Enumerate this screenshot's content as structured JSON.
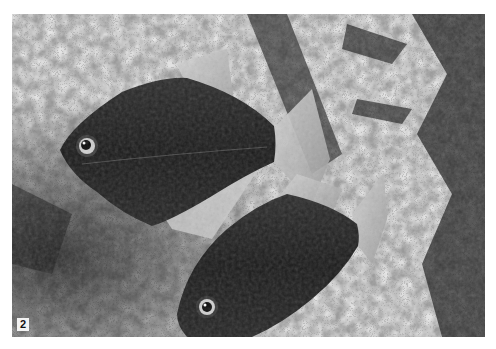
{
  "image": {
    "description": "Black-and-white photograph of two dark disc-shaped fish (silver dollar / hatchet-like characins) swimming over a speckled rocky background with dark plants on the right",
    "figure_label": "2",
    "colors": {
      "background": "#ffffff",
      "rock_light": "#d8d8d8",
      "rock_dark": "#3a3a3a",
      "fish_body": "#1e1e1e",
      "fin": "#bdbdbd",
      "label_bg": "#f2f2f2"
    }
  }
}
